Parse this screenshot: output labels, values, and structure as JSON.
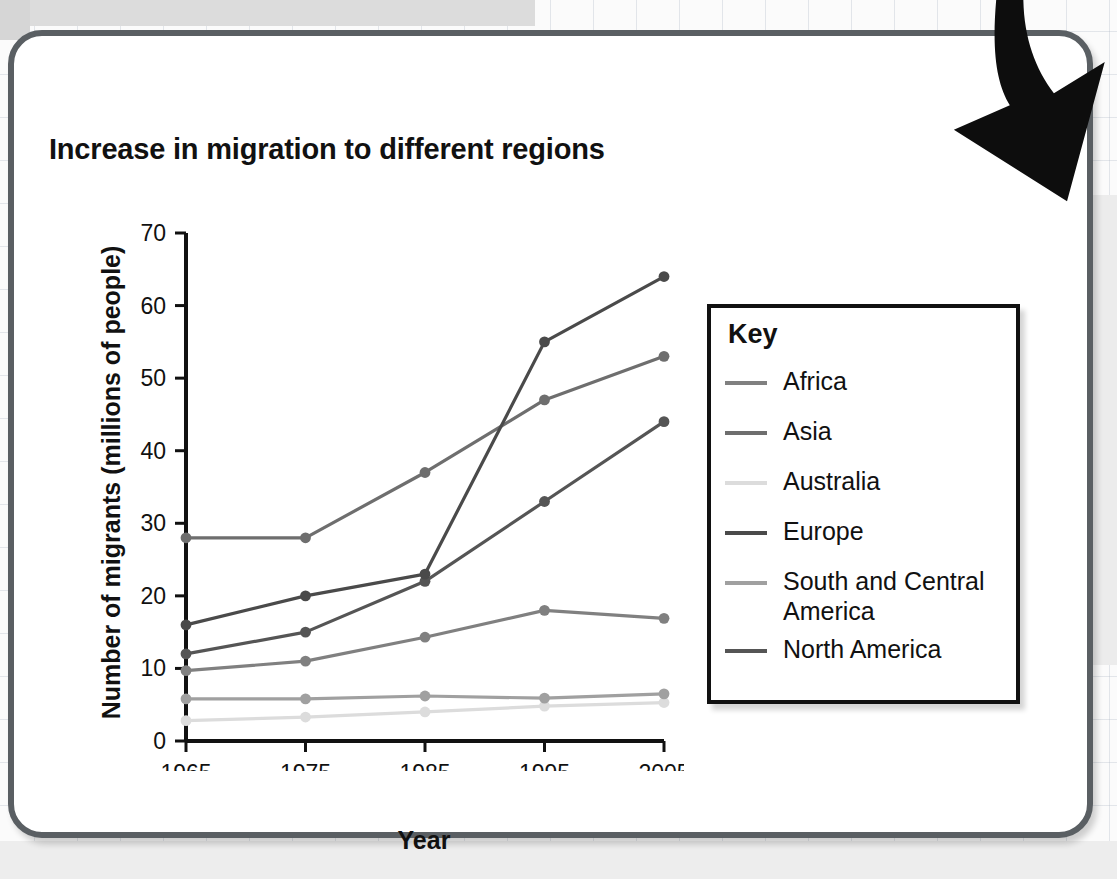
{
  "chart_data": {
    "type": "line",
    "title": "Increase in migration to different regions",
    "xlabel": "Year",
    "ylabel": "Number of migrants (millions of people)",
    "x": [
      1965,
      1975,
      1985,
      1995,
      2005
    ],
    "categories": [
      "1965",
      "1975",
      "1985",
      "1995",
      "2005"
    ],
    "xtick_labels": [
      "1965",
      "1975",
      "1985",
      "1995",
      "2005"
    ],
    "ytick_labels": [
      "0",
      "10",
      "20",
      "30",
      "40",
      "50",
      "60",
      "70"
    ],
    "yticks": [
      0,
      10,
      20,
      30,
      40,
      50,
      60,
      70
    ],
    "ylim": [
      0,
      70
    ],
    "xlim": [
      1965,
      2005
    ],
    "grid": false,
    "legend_position": "right",
    "legend_title": "Key",
    "series": [
      {
        "name": "Africa",
        "color": "#808080",
        "values": [
          9.7,
          11.0,
          14.3,
          18.0,
          16.9
        ]
      },
      {
        "name": "Asia",
        "color": "#6e6e6e",
        "values": [
          28.0,
          28.0,
          37.0,
          47.0,
          53.0
        ]
      },
      {
        "name": "Australia",
        "color": "#dcdcdc",
        "values": [
          2.8,
          3.3,
          4.0,
          4.8,
          5.3
        ]
      },
      {
        "name": "Europe",
        "color": "#4a4a4a",
        "values": [
          16.0,
          20.0,
          23.0,
          55.0,
          64.0
        ]
      },
      {
        "name": "South and Central America",
        "color": "#a0a0a0",
        "values": [
          5.8,
          5.8,
          6.2,
          5.9,
          6.5
        ]
      },
      {
        "name": "North America",
        "color": "#555555",
        "values": [
          12.0,
          15.0,
          22.0,
          33.0,
          44.0
        ]
      }
    ]
  },
  "legend": {
    "title": "Key",
    "items": [
      {
        "label": "Africa"
      },
      {
        "label": "Asia"
      },
      {
        "label": "Australia"
      },
      {
        "label": "Europe"
      },
      {
        "label": "South and Central America"
      },
      {
        "label": "North America"
      }
    ]
  },
  "decor": {
    "arrow_name": "curved-down-right-arrow"
  }
}
